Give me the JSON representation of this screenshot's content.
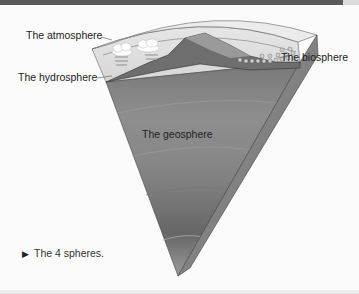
{
  "figure": {
    "labels": {
      "atmosphere": "The atmosphere",
      "hydrosphere": "The hydrosphere",
      "biosphere": "The biosphere",
      "geosphere": "The geosphere"
    },
    "caption": {
      "marker": "▶",
      "text": "The 4 spheres."
    },
    "colors": {
      "top_bar": "#5a5a5a",
      "atmosphere": "#e2e2e2",
      "land": "#8a8a8a",
      "geosphere_bands": [
        "#7a7a7a",
        "#8c8c8c",
        "#808080",
        "#6e6e6e",
        "#5e5e5e"
      ],
      "side_face": "#b0b0b0"
    }
  }
}
